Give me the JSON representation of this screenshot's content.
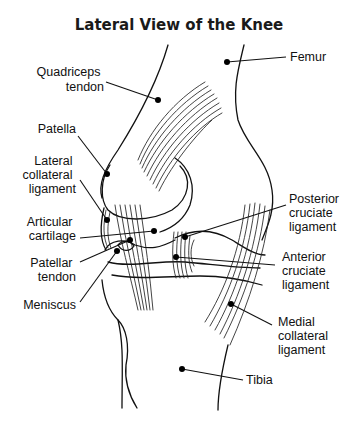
{
  "title": "Lateral View of the Knee",
  "labels": {
    "femur": [
      "Femur"
    ],
    "quadriceps_tendon": [
      "Quadriceps",
      "tendon"
    ],
    "patella": [
      "Patella"
    ],
    "lateral_collateral_ligament": [
      "Lateral",
      "collateral",
      "ligament"
    ],
    "articular_cartilage": [
      "Articular",
      "cartilage"
    ],
    "patellar_tendon": [
      "Patellar",
      "tendon"
    ],
    "meniscus": [
      "Meniscus"
    ],
    "posterior_cruciate_ligament": [
      "Posterior",
      "cruciate",
      "ligament"
    ],
    "anterior_cruciate_ligament": [
      "Anterior",
      "cruciate",
      "ligament"
    ],
    "medial_collateral_ligament": [
      "Medial",
      "collateral",
      "ligament"
    ],
    "tibia": [
      "Tibia"
    ]
  },
  "colors": {
    "ink": "#111111",
    "background": "#ffffff"
  }
}
